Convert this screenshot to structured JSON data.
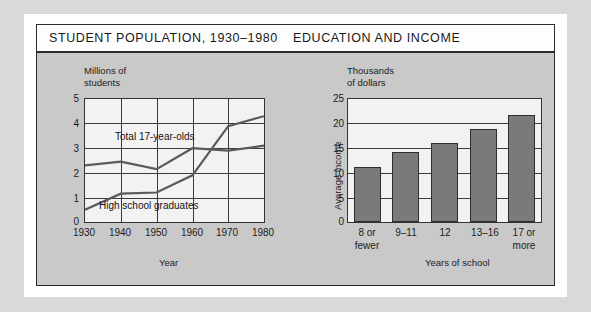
{
  "page": {
    "background_color": "#d9d9d9",
    "panel_color": "#c9c9c9",
    "plot_color": "#f2f2f2",
    "bar_color": "#7a7a7a",
    "line_color": "#555555"
  },
  "titlebar": {
    "left_title": "STUDENT POPULATION, 1930–1980",
    "right_title": "EDUCATION AND INCOME"
  },
  "chart_data": [
    {
      "type": "line",
      "title": "STUDENT POPULATION, 1930–1980",
      "ylabel_lines": [
        "Millions of",
        "students"
      ],
      "xlabel": "Year",
      "x": [
        1930,
        1940,
        1950,
        1960,
        1970,
        1980
      ],
      "xticklabels": [
        "1930",
        "1940",
        "1950",
        "1960",
        "1970",
        "1980"
      ],
      "yticklabels": [
        "0",
        "1",
        "2",
        "3",
        "4",
        "5"
      ],
      "yticks": [
        0,
        1,
        2,
        3,
        4,
        5
      ],
      "ylim": [
        0,
        5
      ],
      "grid": "both",
      "series": [
        {
          "name": "Total 17-year-olds",
          "values": [
            2.3,
            2.45,
            2.15,
            3.0,
            2.9,
            3.1
          ],
          "label_text": "Total 17-year-olds"
        },
        {
          "name": "High school graduates",
          "values": [
            0.5,
            1.15,
            1.2,
            1.9,
            3.9,
            4.3
          ],
          "label_text": "High school graduates"
        }
      ]
    },
    {
      "type": "bar",
      "title": "EDUCATION AND INCOME",
      "ylabel_lines": [
        "Thousands",
        "of dollars"
      ],
      "ylabel_rotated": "Average income",
      "xlabel": "Years of school",
      "categories": [
        "8 or fewer",
        "9–11",
        "12",
        "13–16",
        "17 or more"
      ],
      "category_lines": [
        [
          "8 or",
          "fewer"
        ],
        [
          "9–11",
          ""
        ],
        [
          "12",
          ""
        ],
        [
          "13–16",
          ""
        ],
        [
          "17 or",
          "more"
        ]
      ],
      "values": [
        11.2,
        14.2,
        16.0,
        19.0,
        21.7
      ],
      "yticklabels": [
        "0",
        "5",
        "10",
        "15",
        "20",
        "25"
      ],
      "yticks": [
        0,
        5,
        10,
        15,
        20,
        25
      ],
      "ylim": [
        0,
        25
      ],
      "grid": "horizontal"
    }
  ]
}
